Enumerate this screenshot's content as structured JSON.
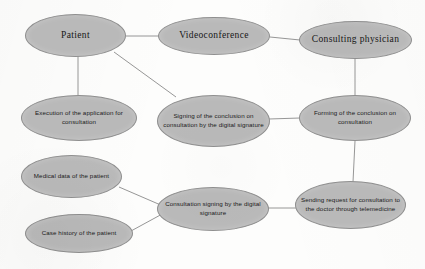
{
  "diagram": {
    "style": {
      "node_fill": "#b9b9b9",
      "node_border": "#8f8f8f",
      "edge_color": "#8a8a8a",
      "text_color": "#1a1a1a",
      "background": "#fdfdfc"
    },
    "nodes": [
      {
        "id": "patient",
        "label": "Patient",
        "font": "serif",
        "x": 25,
        "y": 14,
        "w": 101,
        "h": 43
      },
      {
        "id": "videoconference",
        "label": "Videoconference",
        "font": "serif",
        "x": 158,
        "y": 17,
        "w": 112,
        "h": 38
      },
      {
        "id": "consulting-physician",
        "label": "Consulting physician",
        "font": "serif",
        "x": 299,
        "y": 21,
        "w": 113,
        "h": 38
      },
      {
        "id": "execution-of-application",
        "label": "Execution of the application for consultation",
        "font": "sans",
        "x": 21,
        "y": 95,
        "w": 116,
        "h": 46
      },
      {
        "id": "signing-of-conclusion",
        "label": "Signing of the conclusion on consultation by the digital signature",
        "font": "sans",
        "x": 157,
        "y": 95,
        "w": 113,
        "h": 52
      },
      {
        "id": "forming-of-conclusion",
        "label": "Forming of the conclusion on consultation",
        "font": "sans",
        "x": 299,
        "y": 95,
        "w": 112,
        "h": 46
      },
      {
        "id": "medical-data",
        "label": "Medical data of the patient",
        "font": "sans",
        "x": 21,
        "y": 155,
        "w": 101,
        "h": 43
      },
      {
        "id": "consultation-signing",
        "label": "Consultation signing by the digital signature",
        "font": "sans",
        "x": 157,
        "y": 187,
        "w": 112,
        "h": 44
      },
      {
        "id": "sending-request",
        "label": "Sending request for consultation to the doctor through telemedicine",
        "font": "sans",
        "x": 295,
        "y": 181,
        "w": 111,
        "h": 48
      },
      {
        "id": "case-history",
        "label": "Case history of the patient",
        "font": "sans",
        "x": 25,
        "y": 214,
        "w": 108,
        "h": 39
      }
    ],
    "edges": [
      {
        "id": "patient-videoconference",
        "from": "patient",
        "to": "videoconference",
        "x1": 126,
        "y1": 36,
        "x2": 159,
        "y2": 36
      },
      {
        "id": "videoconference-consulting-physician",
        "from": "videoconference",
        "to": "consulting-physician",
        "x1": 270,
        "y1": 37,
        "x2": 300,
        "y2": 40
      },
      {
        "id": "patient-execution",
        "from": "patient",
        "to": "execution-of-application",
        "x1": 78,
        "y1": 56,
        "x2": 78,
        "y2": 96
      },
      {
        "id": "patient-signing",
        "from": "patient",
        "to": "signing-of-conclusion",
        "x1": 114,
        "y1": 52,
        "x2": 176,
        "y2": 97
      },
      {
        "id": "consulting-physician-forming",
        "from": "consulting-physician",
        "to": "forming-of-conclusion",
        "x1": 355,
        "y1": 58,
        "x2": 355,
        "y2": 96
      },
      {
        "id": "signing-forming",
        "from": "signing-of-conclusion",
        "to": "forming-of-conclusion",
        "x1": 269,
        "y1": 119,
        "x2": 300,
        "y2": 118
      },
      {
        "id": "forming-sending",
        "from": "forming-of-conclusion",
        "to": "sending-request",
        "x1": 355,
        "y1": 141,
        "x2": 353,
        "y2": 182
      },
      {
        "id": "medical-data-consultation",
        "from": "medical-data",
        "to": "consultation-signing",
        "x1": 119,
        "y1": 187,
        "x2": 163,
        "y2": 206
      },
      {
        "id": "case-history-consultation",
        "from": "case-history",
        "to": "consultation-signing",
        "x1": 131,
        "y1": 231,
        "x2": 164,
        "y2": 213
      },
      {
        "id": "consultation-sending",
        "from": "consultation-signing",
        "to": "sending-request",
        "x1": 268,
        "y1": 208,
        "x2": 297,
        "y2": 208
      }
    ]
  }
}
